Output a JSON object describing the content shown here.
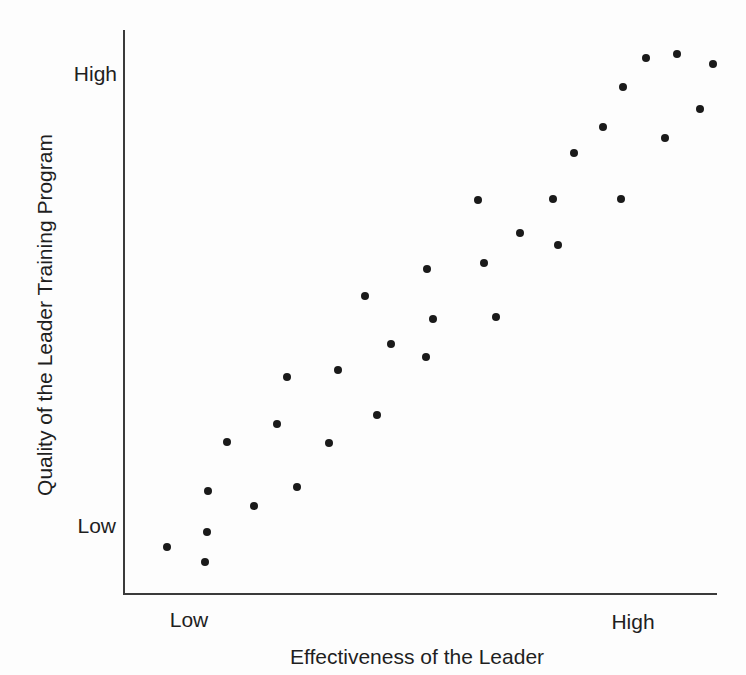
{
  "chart_data": {
    "type": "scatter",
    "title": "",
    "xlabel": "Effectiveness of the Leader",
    "ylabel": "Quality of the Leader Training Program",
    "x_axis_ticks": [
      "Low",
      "High"
    ],
    "y_axis_ticks": [
      "Low",
      "High"
    ],
    "axis_scale": "qualitative Low-to-High on both axes, no numeric tick marks",
    "legend": "none",
    "grid": false,
    "point_count": 32,
    "relationship": "strong positive correlation",
    "points_normalized_0to1": [
      {
        "x": 0.074,
        "y": 0.082
      },
      {
        "x": 0.138,
        "y": 0.055
      },
      {
        "x": 0.141,
        "y": 0.108
      },
      {
        "x": 0.143,
        "y": 0.181
      },
      {
        "x": 0.175,
        "y": 0.268
      },
      {
        "x": 0.221,
        "y": 0.155
      },
      {
        "x": 0.259,
        "y": 0.3
      },
      {
        "x": 0.276,
        "y": 0.384
      },
      {
        "x": 0.293,
        "y": 0.188
      },
      {
        "x": 0.347,
        "y": 0.266
      },
      {
        "x": 0.362,
        "y": 0.396
      },
      {
        "x": 0.407,
        "y": 0.528
      },
      {
        "x": 0.428,
        "y": 0.316
      },
      {
        "x": 0.451,
        "y": 0.442
      },
      {
        "x": 0.51,
        "y": 0.419
      },
      {
        "x": 0.512,
        "y": 0.575
      },
      {
        "x": 0.522,
        "y": 0.487
      },
      {
        "x": 0.598,
        "y": 0.698
      },
      {
        "x": 0.608,
        "y": 0.586
      },
      {
        "x": 0.628,
        "y": 0.49
      },
      {
        "x": 0.668,
        "y": 0.639
      },
      {
        "x": 0.724,
        "y": 0.7
      },
      {
        "x": 0.732,
        "y": 0.618
      },
      {
        "x": 0.759,
        "y": 0.781
      },
      {
        "x": 0.808,
        "y": 0.828
      },
      {
        "x": 0.838,
        "y": 0.7
      },
      {
        "x": 0.842,
        "y": 0.899
      },
      {
        "x": 0.88,
        "y": 0.95
      },
      {
        "x": 0.912,
        "y": 0.808
      },
      {
        "x": 0.933,
        "y": 0.957
      },
      {
        "x": 0.971,
        "y": 0.86
      },
      {
        "x": 0.993,
        "y": 0.94
      }
    ]
  },
  "colors": {
    "background": "#fdfdfd",
    "point": "#1a1a1a",
    "axis": "#3a3a3a",
    "text": "#1f1f1f"
  }
}
